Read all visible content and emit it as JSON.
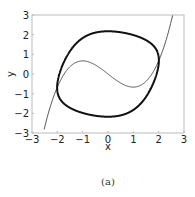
{
  "chart_data": {
    "type": "line",
    "title": "",
    "caption": "(a)",
    "xlabel": "x",
    "ylabel": "y",
    "xlim": [
      -3,
      3
    ],
    "ylim": [
      -3,
      3
    ],
    "xticks": [
      -3,
      -2,
      -1,
      0,
      1,
      2,
      3
    ],
    "yticks": [
      -3,
      -2,
      -1,
      0,
      1,
      2,
      3
    ],
    "grid": false,
    "legend": null,
    "series": [
      {
        "name": "limit cycle",
        "style": "thick",
        "color": "#111111",
        "description": "Van der Pol limit cycle (mu = 1) in Lienard coordinates",
        "points": [
          [
            -2.0,
            -0.67
          ],
          [
            -1.5,
            1.2
          ],
          [
            -1.0,
            1.75
          ],
          [
            0,
            2.17
          ],
          [
            1.0,
            2.0
          ],
          [
            1.8,
            1.3
          ],
          [
            2.0,
            0.67
          ],
          [
            1.95,
            -0.5
          ],
          [
            1.5,
            -1.2
          ],
          [
            1.0,
            -1.75
          ],
          [
            0,
            -2.17
          ],
          [
            -1.0,
            -2.0
          ],
          [
            -1.8,
            -1.3
          ],
          [
            -2.0,
            -0.67
          ]
        ]
      },
      {
        "name": "nullcline y = x^3/3 - x",
        "style": "thin",
        "color": "#444444",
        "x_range": [
          -2.52,
          2.55
        ],
        "points": [
          [
            -2.5,
            -2.71
          ],
          [
            -2,
            -0.67
          ],
          [
            -1,
            0.67
          ],
          [
            0,
            0
          ],
          [
            1,
            -0.67
          ],
          [
            2,
            0.67
          ],
          [
            2.5,
            2.71
          ]
        ]
      }
    ]
  }
}
